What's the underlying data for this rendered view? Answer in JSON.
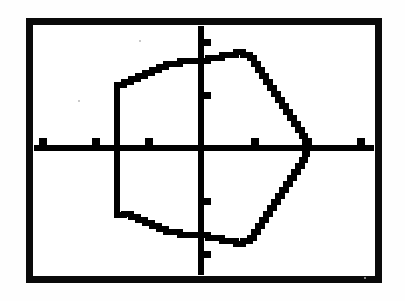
{
  "screen": {
    "device": "graphing-calculator-screen",
    "frame_color": "#0a0a0a",
    "background_color": "#ffffff",
    "ink_color": "#000000",
    "frame": {
      "x": 26,
      "y": 18,
      "width": 356,
      "height": 265,
      "border_width": 7
    }
  },
  "chart_data": {
    "type": "line",
    "title": "",
    "subtitle": "",
    "xlabel": "",
    "ylabel": "",
    "grid": false,
    "legend": null,
    "axes": {
      "x_axis_y_pixel": 148,
      "y_axis_x_pixel": 201,
      "x_tick_spacing_px": 53,
      "y_tick_spacing_px": 53,
      "x_tick_pixels": [
        42,
        95,
        148,
        254,
        307,
        360
      ],
      "y_tick_pixels": [
        42,
        95,
        201,
        254
      ],
      "xlim": [
        -3,
        3
      ],
      "ylim": [
        -2.2,
        2.2
      ],
      "x_tick_values": [
        -3,
        -2,
        -1,
        1,
        2,
        3
      ],
      "y_tick_values": [
        2,
        1,
        -1,
        -2
      ]
    },
    "annotations": [],
    "series": [
      {
        "name": "plotted-curve",
        "closed": true,
        "style": "pixelated-staircase",
        "description": "closed curve symmetric about the x-axis; flat vertical left edge, cusp vertex on the positive x-axis at the right",
        "points_px": [
          [
            117,
            215
          ],
          [
            117,
            85
          ],
          [
            124,
            85
          ],
          [
            124,
            82
          ],
          [
            131,
            82
          ],
          [
            131,
            79
          ],
          [
            138,
            79
          ],
          [
            138,
            76
          ],
          [
            145,
            76
          ],
          [
            145,
            73
          ],
          [
            152,
            73
          ],
          [
            152,
            70
          ],
          [
            159,
            70
          ],
          [
            159,
            67
          ],
          [
            166,
            67
          ],
          [
            166,
            64
          ],
          [
            173,
            64
          ],
          [
            180,
            64
          ],
          [
            180,
            61
          ],
          [
            187,
            61
          ],
          [
            194,
            61
          ],
          [
            201,
            61
          ],
          [
            208,
            61
          ],
          [
            208,
            58
          ],
          [
            215,
            58
          ],
          [
            222,
            58
          ],
          [
            222,
            55
          ],
          [
            229,
            55
          ],
          [
            236,
            55
          ],
          [
            236,
            52
          ],
          [
            243,
            52
          ],
          [
            243,
            55
          ],
          [
            250,
            55
          ],
          [
            250,
            58
          ],
          [
            254,
            58
          ],
          [
            254,
            64
          ],
          [
            258,
            64
          ],
          [
            258,
            70
          ],
          [
            262,
            70
          ],
          [
            262,
            76
          ],
          [
            266,
            76
          ],
          [
            266,
            82
          ],
          [
            270,
            82
          ],
          [
            270,
            88
          ],
          [
            274,
            88
          ],
          [
            274,
            94
          ],
          [
            278,
            94
          ],
          [
            278,
            100
          ],
          [
            282,
            100
          ],
          [
            282,
            106
          ],
          [
            286,
            106
          ],
          [
            286,
            112
          ],
          [
            290,
            112
          ],
          [
            290,
            118
          ],
          [
            294,
            118
          ],
          [
            294,
            124
          ],
          [
            298,
            124
          ],
          [
            298,
            130
          ],
          [
            302,
            130
          ],
          [
            302,
            136
          ],
          [
            305,
            136
          ],
          [
            305,
            142
          ],
          [
            307,
            142
          ],
          [
            307,
            148
          ],
          [
            307,
            154
          ],
          [
            305,
            154
          ],
          [
            305,
            160
          ],
          [
            302,
            160
          ],
          [
            302,
            166
          ],
          [
            298,
            166
          ],
          [
            298,
            172
          ],
          [
            294,
            172
          ],
          [
            294,
            178
          ],
          [
            290,
            178
          ],
          [
            290,
            184
          ],
          [
            286,
            184
          ],
          [
            286,
            190
          ],
          [
            282,
            190
          ],
          [
            282,
            196
          ],
          [
            278,
            196
          ],
          [
            278,
            202
          ],
          [
            274,
            202
          ],
          [
            274,
            208
          ],
          [
            270,
            208
          ],
          [
            270,
            214
          ],
          [
            266,
            214
          ],
          [
            266,
            220
          ],
          [
            262,
            220
          ],
          [
            262,
            226
          ],
          [
            258,
            226
          ],
          [
            258,
            232
          ],
          [
            254,
            232
          ],
          [
            254,
            238
          ],
          [
            250,
            238
          ],
          [
            250,
            241
          ],
          [
            243,
            241
          ],
          [
            243,
            244
          ],
          [
            236,
            244
          ],
          [
            236,
            241
          ],
          [
            229,
            241
          ],
          [
            222,
            241
          ],
          [
            222,
            238
          ],
          [
            215,
            238
          ],
          [
            208,
            238
          ],
          [
            208,
            235
          ],
          [
            201,
            235
          ],
          [
            194,
            235
          ],
          [
            187,
            235
          ],
          [
            180,
            235
          ],
          [
            180,
            232
          ],
          [
            173,
            232
          ],
          [
            166,
            232
          ],
          [
            166,
            229
          ],
          [
            159,
            229
          ],
          [
            159,
            226
          ],
          [
            152,
            226
          ],
          [
            152,
            223
          ],
          [
            145,
            223
          ],
          [
            145,
            220
          ],
          [
            138,
            220
          ],
          [
            138,
            217
          ],
          [
            131,
            217
          ],
          [
            131,
            214
          ],
          [
            124,
            214
          ],
          [
            124,
            215
          ],
          [
            117,
            215
          ]
        ],
        "x_intercept_right_px": 307,
        "left_edge_x_px": 117,
        "top_px": 52,
        "bottom_px": 244
      }
    ]
  }
}
